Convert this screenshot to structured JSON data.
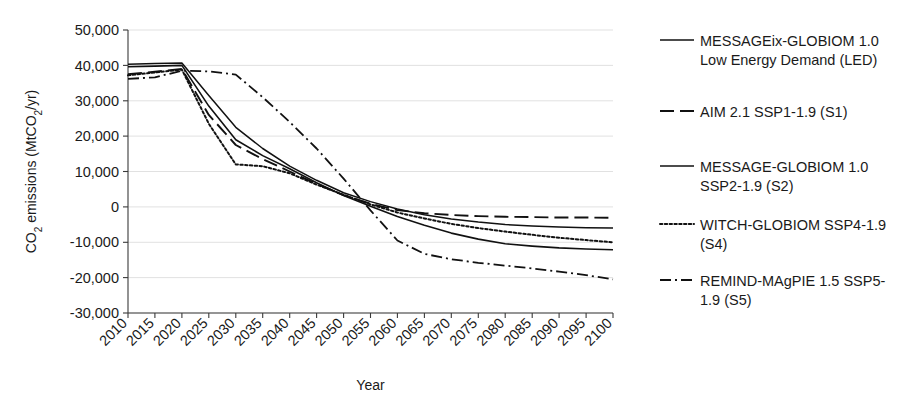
{
  "chart_data": {
    "type": "line",
    "title": "",
    "xlabel": "Year",
    "ylabel": "CO2 emissions (MtCO2/yr)",
    "ylabel_parts": {
      "pre": "CO",
      "sub1": "2",
      "mid": " emissions (MtCO",
      "sub2": "2",
      "post": "/yr)"
    },
    "xlim": [
      2010,
      2100
    ],
    "ylim": [
      -30000,
      50000
    ],
    "grid": true,
    "legend_position": "right",
    "x": [
      2010,
      2015,
      2020,
      2025,
      2030,
      2035,
      2040,
      2045,
      2050,
      2055,
      2060,
      2065,
      2070,
      2075,
      2080,
      2085,
      2090,
      2095,
      2100
    ],
    "xtick_labels": [
      "2010",
      "2015",
      "2020",
      "2025",
      "2030",
      "2035",
      "2040",
      "2045",
      "2050",
      "2055",
      "2060",
      "2065",
      "2070",
      "2075",
      "2080",
      "2085",
      "2090",
      "2095",
      "2100"
    ],
    "ytick_labels": [
      "50,000",
      "40,000",
      "30,000",
      "20,000",
      "10,000",
      "0",
      "-10,000",
      "-20,000",
      "-30,000"
    ],
    "ytick_values": [
      50000,
      40000,
      30000,
      20000,
      10000,
      0,
      -10000,
      -20000,
      -30000
    ],
    "series": [
      {
        "name": "MESSAGEix-GLOBIOM 1.0 Low Energy Demand (LED)",
        "key": "S0",
        "style": "solid",
        "color": "#111111",
        "width": 1.5,
        "values": [
          40300,
          40500,
          40700,
          31500,
          22500,
          16500,
          11500,
          7500,
          4000,
          1500,
          -600,
          -2200,
          -3400,
          -4300,
          -5000,
          -5400,
          -5700,
          -5900,
          -6000
        ]
      },
      {
        "name": "AIM 2.1 SSP1-1.9 (S1)",
        "key": "S1",
        "style": "dashed",
        "color": "#111111",
        "width": 1.9,
        "values": [
          37500,
          38200,
          39000,
          26000,
          17500,
          13500,
          10000,
          6500,
          3300,
          900,
          -900,
          -1800,
          -2300,
          -2600,
          -2800,
          -2900,
          -3000,
          -3000,
          -3100
        ]
      },
      {
        "name": "MESSAGE-GLOBIOM 1.0 SSP2-1.9 (S2)",
        "key": "S2",
        "style": "solid",
        "color": "#111111",
        "width": 1.6,
        "values": [
          39600,
          39800,
          40000,
          28500,
          19000,
          14500,
          10800,
          6800,
          3200,
          200,
          -2700,
          -5200,
          -7400,
          -9100,
          -10400,
          -11100,
          -11600,
          -11900,
          -12100
        ]
      },
      {
        "name": "WITCH-GLOBIOM SSP4-1.9 (S4)",
        "key": "S4",
        "style": "dotted",
        "color": "#111111",
        "width": 2.0,
        "values": [
          37200,
          38000,
          38800,
          23500,
          12000,
          11500,
          9500,
          6300,
          3400,
          700,
          -1600,
          -3300,
          -4800,
          -6000,
          -7000,
          -7900,
          -8700,
          -9400,
          -10000
        ]
      },
      {
        "name": "REMIND-MAgPIE 1.5 SSP5-1.9 (S5)",
        "key": "S5",
        "style": "dashdot",
        "color": "#111111",
        "width": 1.8,
        "values": [
          36200,
          36600,
          38500,
          38300,
          37400,
          31000,
          24000,
          16500,
          8000,
          -1000,
          -9500,
          -13300,
          -14800,
          -15800,
          -16600,
          -17400,
          -18300,
          -19300,
          -20500
        ]
      }
    ]
  },
  "legend": {
    "entries": [
      {
        "label_line1": "MESSAGEix-GLOBIOM 1.0",
        "label_line2": "Low Energy Demand (LED)",
        "style": "solid"
      },
      {
        "label_line1": "AIM 2.1 SSP1-1.9 (S1)",
        "label_line2": "",
        "style": "dashed"
      },
      {
        "label_line1": "MESSAGE-GLOBIOM 1.0",
        "label_line2": "SSP2-1.9 (S2)",
        "style": "solid"
      },
      {
        "label_line1": "WITCH-GLOBIOM SSP4-1.9",
        "label_line2": "(S4)",
        "style": "dotted"
      },
      {
        "label_line1": "REMIND-MAgPIE 1.5 SSP5-",
        "label_line2": "1.9 (S5)",
        "style": "dashdot"
      }
    ]
  }
}
